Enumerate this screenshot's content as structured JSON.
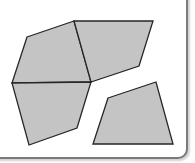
{
  "diagram": {
    "colors": {
      "fill": "#c4c4c4",
      "stroke": "#262626",
      "background": "#ffffff",
      "frame": "#7a7a7a"
    },
    "shapes": [
      {
        "name": "top-left-quad",
        "points": "27,37 74,21 91,82 12,83"
      },
      {
        "name": "top-right-quad",
        "points": "74,21 153,21 139,66 91,82"
      },
      {
        "name": "bottom-left-quad",
        "points": "12,83 91,82 77,128 29,145"
      },
      {
        "name": "separate-quad",
        "points": "108,98 156,82 173,144 93,144"
      }
    ]
  }
}
